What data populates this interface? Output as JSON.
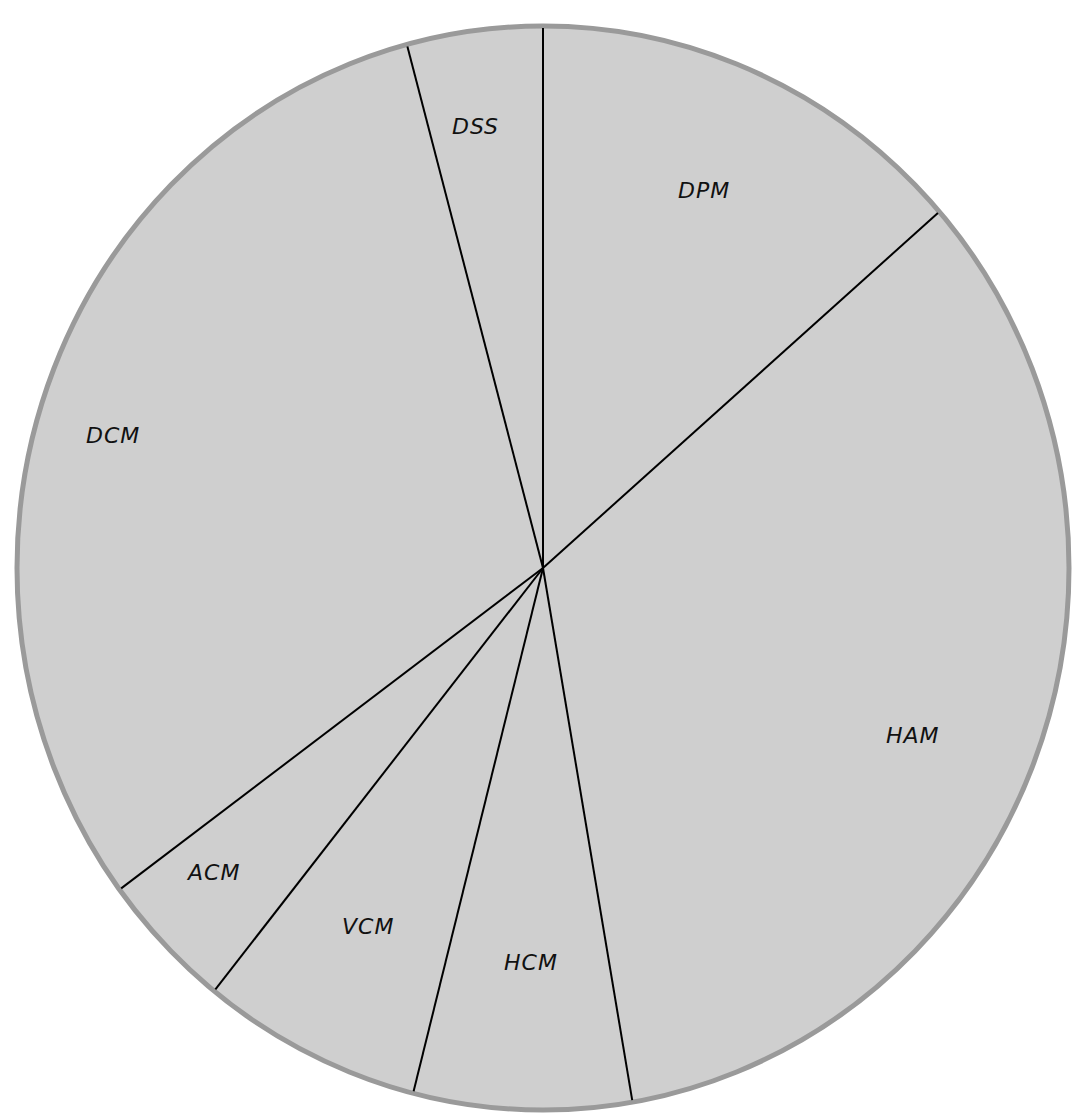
{
  "chart_data": {
    "type": "pie",
    "title": "",
    "subtitle": "",
    "units": "degrees (estimated from slice boundaries)",
    "categories": [
      "DPM",
      "HAM",
      "HCM",
      "VCM",
      "ACM",
      "DCM",
      "DSS"
    ],
    "values": [
      48.9,
      121.3,
      24.1,
      24.4,
      14.9,
      111.4,
      15.0
    ],
    "percentages": [
      13.6,
      33.7,
      6.7,
      6.8,
      4.1,
      30.9,
      4.2
    ],
    "start_angle_deg": 0,
    "direction": "clockwise",
    "legend": "none (labels inside slices)"
  },
  "style": {
    "background": "#ffffff",
    "slice_fill": "#cfcfcf",
    "rim_color": "#9a9a9a",
    "divider_color": "#000000",
    "label_color": "#111111"
  },
  "geometry": {
    "cx": 543,
    "cy": 568,
    "rx": 526,
    "ry": 542
  },
  "labels": {
    "dpm": "DPM",
    "ham": "HAM",
    "hcm": "HCM",
    "vcm": "VCM",
    "acm": "ACM",
    "dcm": "DCM",
    "dss": "DSS"
  }
}
